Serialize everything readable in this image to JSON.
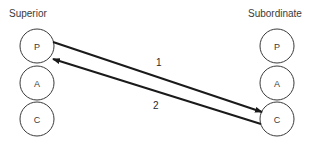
{
  "diagram": {
    "left_group": {
      "title": "Superior",
      "states": [
        "P",
        "A",
        "C"
      ]
    },
    "right_group": {
      "title": "Subordinate",
      "states": [
        "P",
        "A",
        "C"
      ]
    },
    "transactions": [
      {
        "number": "1",
        "from": "Superior.P",
        "to": "Subordinate.C"
      },
      {
        "number": "2",
        "from": "Subordinate.C",
        "to": "Superior.P"
      }
    ]
  }
}
